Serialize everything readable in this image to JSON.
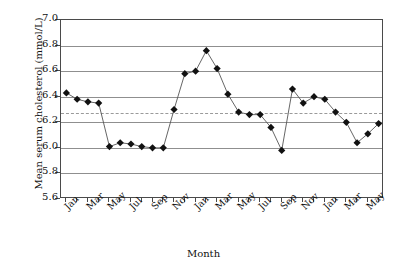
{
  "chart_data": {
    "type": "line",
    "title": "",
    "xlabel": "Month",
    "ylabel": "Mean serum cholesterol (mmol/L)",
    "ylim": [
      5.6,
      7.0
    ],
    "ytick_values": [
      5.6,
      5.8,
      6.0,
      6.2,
      6.4,
      6.6,
      6.8,
      7.0
    ],
    "ytick_labels": [
      "5.6",
      "5.8",
      "6.0",
      "6.2",
      "6.4",
      "6.6",
      "6.8",
      "7.0"
    ],
    "grid": true,
    "grid_axis": "y",
    "legend": "none",
    "marker": "filled-diamond",
    "marker_color": "#111111",
    "line_color": "#555555",
    "reference_line": {
      "value": 6.27,
      "style": "dashed",
      "color": "#9a9a9a"
    },
    "x": [
      1,
      2,
      3,
      4,
      5,
      6,
      7,
      8,
      9,
      10,
      11,
      12,
      13,
      14,
      15,
      16,
      17,
      18,
      19,
      20,
      21,
      22,
      23,
      24,
      25,
      26,
      27,
      28,
      29
    ],
    "xtick_labels": [
      "Jan",
      "",
      "Mar",
      "",
      "May",
      "",
      "Jul",
      "",
      "Sep",
      "",
      "Nov",
      "",
      "Jan",
      "",
      "Mar",
      "",
      "May",
      "",
      "Jul",
      "",
      "Sep",
      "",
      "Nov",
      "",
      "Jan",
      "",
      "Mar",
      "",
      "May"
    ],
    "xtick_labels_shown": [
      "Jan",
      "Mar",
      "May",
      "Jul",
      "Sep",
      "Nov",
      "Jan",
      "Mar",
      "May",
      "Jul",
      "Sep",
      "Nov",
      "Jan",
      "Mar",
      "May"
    ],
    "categories": [
      "Jan",
      "Feb",
      "Mar",
      "Apr",
      "May",
      "Jun",
      "Jul",
      "Aug",
      "Sep",
      "Oct",
      "Nov",
      "Dec",
      "Jan",
      "Feb",
      "Mar",
      "Apr",
      "May",
      "Jun",
      "Jul",
      "Aug",
      "Sep",
      "Oct",
      "Nov",
      "Dec",
      "Jan",
      "Feb",
      "Mar",
      "Apr",
      "May"
    ],
    "values": [
      6.43,
      6.38,
      6.36,
      6.35,
      6.01,
      6.04,
      6.03,
      6.01,
      6.0,
      6.0,
      6.3,
      6.58,
      6.6,
      6.76,
      6.62,
      6.42,
      6.28,
      6.26,
      6.26,
      6.16,
      5.98,
      6.46,
      6.35,
      6.4,
      6.38,
      6.28,
      6.2,
      6.04,
      6.11
    ],
    "values_note": "6.19 final"
  },
  "axis": {
    "x_title": "Month",
    "y_title": "Mean serum cholesterol (mmol/L)"
  }
}
